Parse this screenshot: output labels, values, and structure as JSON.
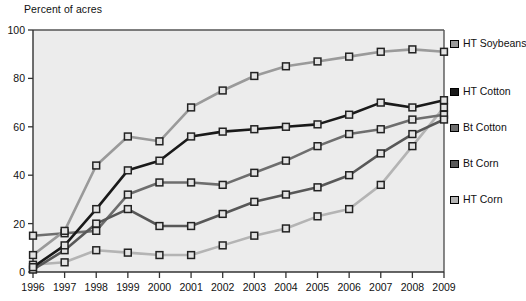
{
  "chart_data": {
    "type": "line",
    "title": "Percent of acres",
    "xlabel": "",
    "ylabel": "Percent of acres",
    "ylim": [
      0,
      100
    ],
    "yticks": [
      0,
      20,
      40,
      60,
      80,
      100
    ],
    "grid": false,
    "legend_position": "right",
    "categories": [
      1996,
      1997,
      1998,
      1999,
      2000,
      2001,
      2002,
      2003,
      2004,
      2005,
      2006,
      2007,
      2008,
      2009
    ],
    "x": [
      "1996",
      "1997",
      "1998",
      "1999",
      "2000",
      "2001",
      "2002",
      "2003",
      "2004",
      "2005",
      "2006",
      "2007",
      "2008",
      "2009"
    ],
    "series": [
      {
        "name": "HT Soybeans",
        "color": "#9a9a9a",
        "marker": "square",
        "values": [
          7,
          17,
          44,
          56,
          54,
          68,
          75,
          81,
          85,
          87,
          89,
          91,
          92,
          91
        ]
      },
      {
        "name": "HT Cotton",
        "color": "#1a1a1a",
        "marker": "square",
        "values": [
          2,
          11,
          26,
          42,
          46,
          56,
          58,
          59,
          60,
          61,
          65,
          70,
          68,
          71
        ]
      },
      {
        "name": "Bt Cotton",
        "color": "#6e6e6e",
        "marker": "square",
        "values": [
          15,
          16,
          17,
          32,
          37,
          37,
          36,
          41,
          46,
          52,
          57,
          59,
          63,
          65
        ]
      },
      {
        "name": "Bt Corn",
        "color": "#585858",
        "marker": "square",
        "values": [
          1,
          9,
          20,
          26,
          19,
          19,
          24,
          29,
          32,
          35,
          40,
          49,
          57,
          63
        ]
      },
      {
        "name": "HT Corn",
        "color": "#b4b4b4",
        "marker": "square",
        "values": [
          3,
          4,
          9,
          8,
          7,
          7,
          11,
          15,
          18,
          23,
          26,
          36,
          52,
          68
        ]
      }
    ]
  },
  "legend": {
    "items": [
      {
        "label": "HT Soybeans"
      },
      {
        "label": "HT Cotton"
      },
      {
        "label": "Bt Cotton"
      },
      {
        "label": "Bt Corn"
      },
      {
        "label": "HT Corn"
      }
    ]
  }
}
